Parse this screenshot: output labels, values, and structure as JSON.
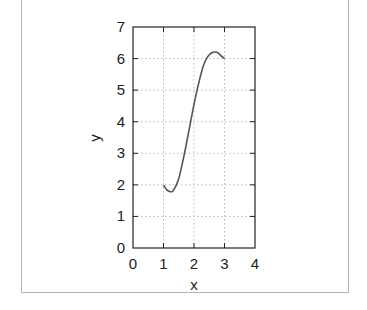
{
  "chart_data": {
    "type": "line",
    "title": "",
    "xlabel": "x",
    "ylabel": "y",
    "xlim": [
      0,
      4
    ],
    "ylim": [
      0,
      7
    ],
    "xticks": [
      "0",
      "1",
      "2",
      "3",
      "4"
    ],
    "yticks": [
      "0",
      "1",
      "2",
      "3",
      "4",
      "5",
      "6",
      "7"
    ],
    "grid": true,
    "legend": null,
    "series": [
      {
        "name": "curve",
        "color": "#555555",
        "x": [
          1.0,
          1.1,
          1.2,
          1.25,
          1.3,
          1.4,
          1.5,
          1.6,
          1.7,
          1.8,
          1.9,
          2.0,
          2.1,
          2.2,
          2.3,
          2.4,
          2.5,
          2.6,
          2.7,
          2.75,
          2.8,
          2.9,
          3.0
        ],
        "values": [
          2.0,
          1.85,
          1.79,
          1.78,
          1.8,
          1.95,
          2.2,
          2.6,
          3.05,
          3.55,
          4.05,
          4.55,
          5.0,
          5.4,
          5.75,
          5.98,
          6.12,
          6.19,
          6.21,
          6.2,
          6.17,
          6.08,
          6.0
        ]
      }
    ]
  },
  "labels": {
    "x": "x",
    "y": "y"
  }
}
